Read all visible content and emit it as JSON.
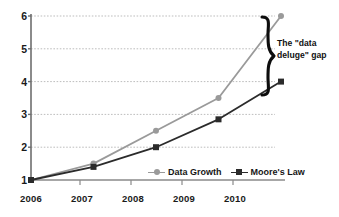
{
  "chart_data": {
    "type": "line",
    "title": "",
    "subtitle": "",
    "xlabel": "",
    "ylabel": "",
    "categories": [
      "2006",
      "2007",
      "2008",
      "2009",
      "2010"
    ],
    "x": [
      2006,
      2007,
      2008,
      2009,
      2010
    ],
    "series": [
      {
        "name": "Data Growth",
        "values": [
          1,
          1.5,
          2.5,
          3.5,
          6
        ],
        "color": "#9a9a9a",
        "marker": "circle"
      },
      {
        "name": "Moore's Law",
        "values": [
          1,
          1.4,
          2.0,
          2.85,
          4.0
        ],
        "color": "#2b2b2b",
        "marker": "square"
      }
    ],
    "ylim": [
      1,
      6
    ],
    "yticks": [
      "1",
      "2",
      "3",
      "4",
      "5",
      "6"
    ],
    "xticks": [
      "2006",
      "2007",
      "2008",
      "2009",
      "2010"
    ],
    "grid": true,
    "grid_color": "#c8c8c8",
    "axis_color": "#6e6e6e",
    "background": "#ffffff",
    "legend_position": "inside-bottom-center",
    "annotations": [
      {
        "name": "data-deluge-gap",
        "text_line_1": "The \"data",
        "text_line_2": "deluge\" gap",
        "shape": "curly-brace",
        "spans_from": 6,
        "spans_to": 4,
        "at_x": "2010"
      }
    ]
  },
  "legend": {
    "items": [
      {
        "label": "Data Growth"
      },
      {
        "label": "Moore's Law"
      }
    ]
  },
  "annotation": {
    "line1": "The \"data",
    "line2": "deluge\" gap"
  }
}
